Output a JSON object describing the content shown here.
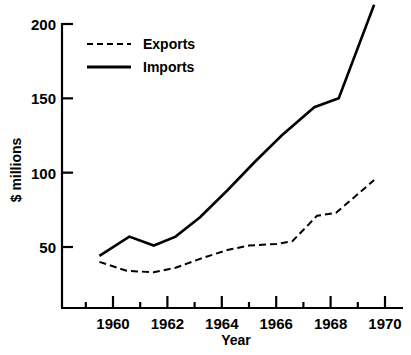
{
  "chart_data": {
    "type": "line",
    "title": "",
    "xlabel": "Year",
    "ylabel": "$ millions",
    "xlim": [
      1958.5,
      1970.5
    ],
    "ylim": [
      0,
      210
    ],
    "grid": false,
    "legend_position": "top-left",
    "y_ticks": [
      200,
      150,
      100,
      50
    ],
    "y_tick_labels": [
      "200",
      "150",
      "100",
      "50"
    ],
    "x_ticks_major": [
      1960,
      1962,
      1964,
      1966,
      1968,
      1970
    ],
    "x_tick_labels": [
      "1960",
      "1962",
      "1964",
      "1966",
      "1968",
      "1970"
    ],
    "x_ticks_minor": [
      1959,
      1961,
      1963,
      1965,
      1967,
      1969
    ],
    "series": [
      {
        "name": "Exports",
        "style": "dashed",
        "color": "#000000",
        "x": [
          1959.5,
          1960.5,
          1961.5,
          1962.3,
          1963.2,
          1964.2,
          1965.0,
          1966.0,
          1966.6,
          1967.5,
          1968.2,
          1969.6
        ],
        "values": [
          40,
          34,
          33,
          36,
          42,
          48,
          51,
          52,
          54,
          71,
          73,
          95
        ]
      },
      {
        "name": "Imports",
        "style": "solid",
        "color": "#000000",
        "x": [
          1959.5,
          1960.6,
          1961.5,
          1962.3,
          1963.2,
          1964.2,
          1965.2,
          1966.2,
          1967.4,
          1968.3,
          1969.6
        ],
        "values": [
          44,
          57,
          51,
          57,
          70,
          88,
          107,
          125,
          144,
          150,
          213
        ]
      }
    ]
  },
  "legend": {
    "entries": [
      {
        "label": "Exports",
        "style": "dashed"
      },
      {
        "label": "Imports",
        "style": "solid"
      }
    ]
  },
  "axes": {
    "x_title": "Year",
    "y_title": "$ millions"
  }
}
